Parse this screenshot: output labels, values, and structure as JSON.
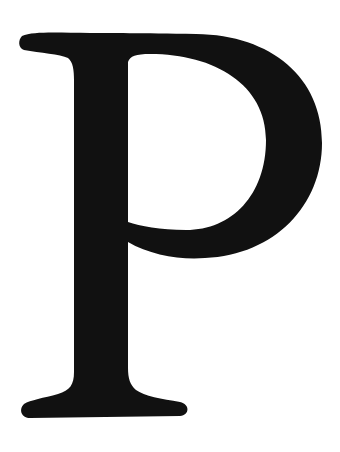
{
  "glyph": {
    "character": "P",
    "fill_color": "#111111",
    "background_color": "#ffffff"
  }
}
